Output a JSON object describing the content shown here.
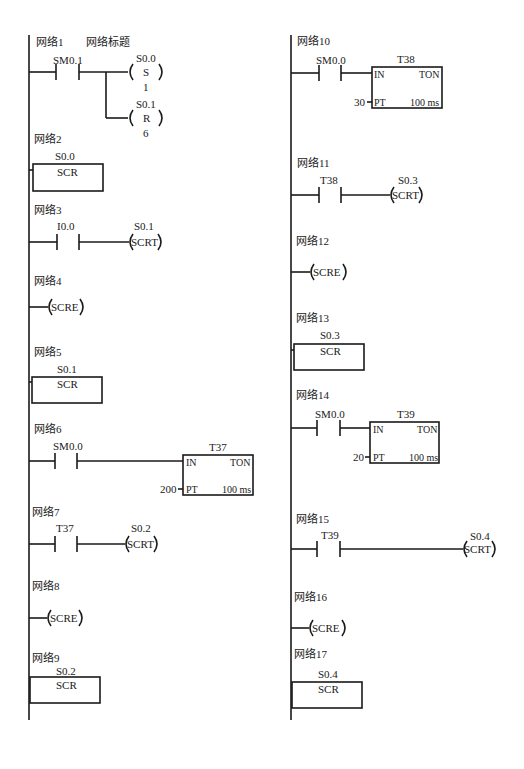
{
  "diagram": {
    "type": "ladder-diagram",
    "left_column": {
      "networks": [
        {
          "label": "网络1",
          "title": "网络标题",
          "contact": "SM0.1",
          "coils": [
            {
              "address": "S0.0",
              "op": "S",
              "n": "1"
            },
            {
              "address": "S0.1",
              "op": "R",
              "n": "6"
            }
          ]
        },
        {
          "label": "网络2",
          "box": {
            "address": "S0.0",
            "name": "SCR"
          }
        },
        {
          "label": "网络3",
          "contact": "I0.0",
          "coil": {
            "address": "S0.1",
            "op": "SCRT"
          }
        },
        {
          "label": "网络4",
          "coil": {
            "op": "SCRE"
          }
        },
        {
          "label": "网络5",
          "box": {
            "address": "S0.1",
            "name": "SCR"
          }
        },
        {
          "label": "网络6",
          "contact": "SM0.0",
          "timer": {
            "name": "T37",
            "type": "TON",
            "in": "IN",
            "pt_label": "PT",
            "pt_value": "200",
            "base": "100 ms"
          }
        },
        {
          "label": "网络7",
          "contact": "T37",
          "coil": {
            "address": "S0.2",
            "op": "SCRT"
          }
        },
        {
          "label": "网络8",
          "coil": {
            "op": "SCRE"
          }
        },
        {
          "label": "网络9",
          "box": {
            "address": "S0.2",
            "name": "SCR"
          }
        }
      ]
    },
    "right_column": {
      "networks": [
        {
          "label": "网络10",
          "contact": "SM0.0",
          "timer": {
            "name": "T38",
            "type": "TON",
            "in": "IN",
            "pt_label": "PT",
            "pt_value": "30",
            "base": "100 ms"
          }
        },
        {
          "label": "网络11",
          "contact": "T38",
          "coil": {
            "address": "S0.3",
            "op": "SCRT"
          }
        },
        {
          "label": "网络12",
          "coil": {
            "op": "SCRE"
          }
        },
        {
          "label": "网络13",
          "box": {
            "address": "S0.3",
            "name": "SCR"
          }
        },
        {
          "label": "网络14",
          "contact": "SM0.0",
          "timer": {
            "name": "T39",
            "type": "TON",
            "in": "IN",
            "pt_label": "PT",
            "pt_value": "20",
            "base": "100 ms"
          }
        },
        {
          "label": "网络15",
          "contact": "T39",
          "coil": {
            "address": "S0.4",
            "op": "SCRT"
          }
        },
        {
          "label": "网络16",
          "coil": {
            "op": "SCRE"
          }
        },
        {
          "label": "网络17",
          "box": {
            "address": "S0.4",
            "name": "SCR"
          }
        }
      ]
    }
  },
  "colors": {
    "line": "#1a1a1a",
    "background": "#ffffff"
  }
}
